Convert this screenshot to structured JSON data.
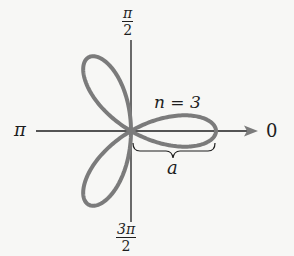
{
  "figure": {
    "curve": {
      "n": 3,
      "a_px": 85,
      "stroke_color": "#7b7b7b",
      "stroke_width": 4
    },
    "axes": {
      "color": "#1e1e1e"
    },
    "labels": {
      "top": {
        "numerator": "π",
        "denominator": "2"
      },
      "bottom": {
        "numerator": "3π",
        "denominator": "2"
      },
      "left": "π",
      "right": "0",
      "n_label": "n = 3",
      "a_label": "a"
    }
  }
}
